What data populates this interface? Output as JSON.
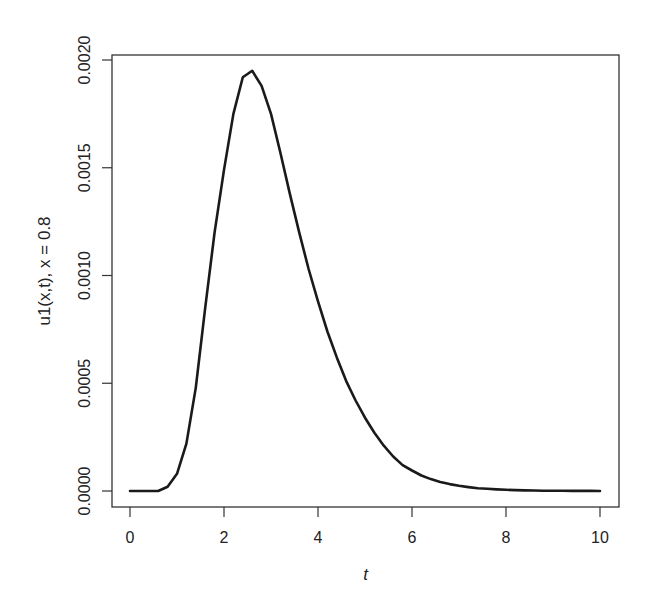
{
  "chart_data": {
    "type": "line",
    "title": "",
    "xlabel": "t",
    "ylabel": "u1(x,t), x = 0.8",
    "xlim": [
      -0.4,
      10.4
    ],
    "ylim": [
      -7e-05,
      0.00205
    ],
    "x_ticks": [
      0,
      2,
      4,
      6,
      8,
      10
    ],
    "x_tick_labels": [
      "0",
      "2",
      "4",
      "6",
      "8",
      "10"
    ],
    "y_ticks": [
      0,
      0.0005,
      0.001,
      0.0015,
      0.002
    ],
    "y_tick_labels": [
      "0.0000",
      "0.0005",
      "0.0010",
      "0.0015",
      "0.0020"
    ],
    "grid": false,
    "legend": null,
    "line_color": "#1a1a1a",
    "series": [
      {
        "name": "u1(x,t), x = 0.8",
        "x": [
          0.0,
          0.2,
          0.4,
          0.6,
          0.8,
          1.0,
          1.2,
          1.4,
          1.6,
          1.8,
          2.0,
          2.2,
          2.4,
          2.6,
          2.8,
          3.0,
          3.2,
          3.4,
          3.6,
          3.8,
          4.0,
          4.2,
          4.4,
          4.6,
          4.8,
          5.0,
          5.2,
          5.4,
          5.6,
          5.8,
          6.0,
          6.2,
          6.4,
          6.6,
          6.8,
          7.0,
          7.2,
          7.4,
          7.6,
          7.8,
          8.0,
          8.2,
          8.4,
          8.6,
          8.8,
          9.0,
          9.2,
          9.4,
          9.6,
          9.8,
          10.0
        ],
        "values": [
          0.0,
          0.0,
          0.0,
          0.0,
          2e-05,
          8e-05,
          0.00022,
          0.00048,
          0.00085,
          0.0012,
          0.00149,
          0.00175,
          0.00192,
          0.00195,
          0.00188,
          0.00175,
          0.00157,
          0.00138,
          0.0012,
          0.00103,
          0.00088,
          0.00074,
          0.00062,
          0.00051,
          0.00042,
          0.00034,
          0.00027,
          0.00021,
          0.00016,
          0.00012,
          9.5e-05,
          7.2e-05,
          5.5e-05,
          4.2e-05,
          3.2e-05,
          2.4e-05,
          1.8e-05,
          1.3e-05,
          1e-05,
          7.5e-06,
          5.5e-06,
          4e-06,
          3e-06,
          2.2e-06,
          1.6e-06,
          1.2e-06,
          9e-07,
          6e-07,
          4e-07,
          3e-07,
          2e-07
        ]
      }
    ]
  },
  "layout": {
    "frame": {
      "left": 112,
      "top": 55,
      "right": 619,
      "bottom": 507
    },
    "x_map": {
      "t0": 0,
      "px0": 130,
      "t1": 10,
      "px1": 600
    },
    "y_map": {
      "v0": 0,
      "py0": 491,
      "v1": 0.002,
      "py1": 60
    }
  }
}
